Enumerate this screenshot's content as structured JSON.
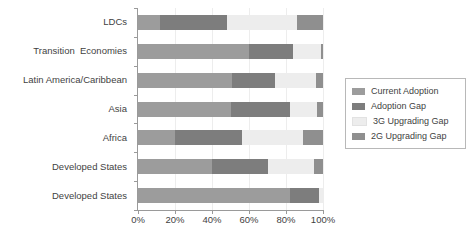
{
  "chart_data": {
    "type": "bar",
    "orientation": "horizontal",
    "stacked": true,
    "title": "",
    "xlabel": "",
    "ylabel": "",
    "xlim": [
      0,
      100
    ],
    "xticks": [
      0,
      20,
      40,
      60,
      80,
      100
    ],
    "xtick_labels": [
      "0%",
      "20%",
      "40%",
      "60%",
      "80%",
      "100%"
    ],
    "grid": true,
    "legend_position": "right",
    "categories": [
      "LDCs",
      "Transition  Economies",
      "Latin America/Caribbean",
      "Asia",
      "Africa",
      "Developed States",
      "Developed States"
    ],
    "series": [
      {
        "name": "Current Adoption",
        "color": "#9c9c9c",
        "values": [
          12,
          60,
          51,
          50,
          20,
          40,
          82
        ]
      },
      {
        "name": "Adoption Gap",
        "color": "#7d7d7d",
        "values": [
          36,
          24,
          23,
          32,
          36,
          30,
          16
        ]
      },
      {
        "name": "3G Upgrading Gap",
        "color": "#ededed",
        "values": [
          38,
          15,
          22,
          15,
          33,
          25,
          2
        ]
      },
      {
        "name": "2G Upgrading Gap",
        "color": "#8f8f8f",
        "values": [
          14,
          1,
          4,
          3,
          11,
          5,
          0
        ]
      }
    ]
  },
  "legend": {
    "items": [
      {
        "label": "Current Adoption",
        "color": "#9c9c9c"
      },
      {
        "label": "Adoption Gap",
        "color": "#7d7d7d"
      },
      {
        "label": "3G Upgrading Gap",
        "color": "#ededed"
      },
      {
        "label": "2G Upgrading Gap",
        "color": "#8f8f8f"
      }
    ]
  },
  "axis": {
    "line_color": "#9a9a9a",
    "grid_color": "#ededed"
  }
}
